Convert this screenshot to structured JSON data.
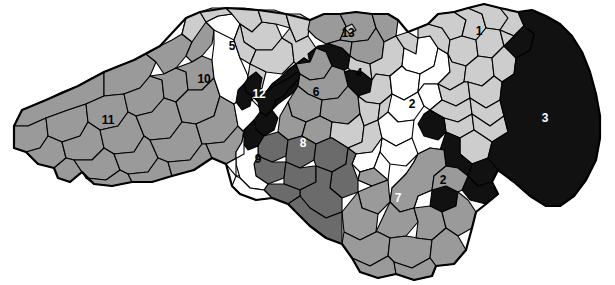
{
  "map": {
    "title": "North Carolina Congressional Districts",
    "region": "North Carolina",
    "width": 615,
    "height": 285,
    "background_color": "#ffffff",
    "border_color": "#000000"
  },
  "legend": {
    "shades": [
      {
        "key": "white",
        "color": "#ffffff",
        "label_color": "#000000"
      },
      {
        "key": "light_gray",
        "color": "#cdcdcd",
        "label_color": "#000000"
      },
      {
        "key": "medium_gray",
        "color": "#9a9a9a",
        "label_color": "#000000"
      },
      {
        "key": "dark_gray",
        "color": "#6b6b6b",
        "label_color": "#ffffff"
      },
      {
        "key": "black",
        "color": "#111111",
        "label_color": "#ffffff"
      }
    ]
  },
  "districts": [
    {
      "number": "1",
      "shade": "light_gray",
      "label_color": "#000000",
      "x": 479,
      "y": 31
    },
    {
      "number": "2",
      "shade": "white",
      "label_color": "#000000",
      "x": 412,
      "y": 104
    },
    {
      "number": "2b",
      "number_text": "2",
      "shade": "medium_gray",
      "label_color": "#000000",
      "x": 443,
      "y": 180
    },
    {
      "number": "3",
      "shade": "black",
      "label_color": "#ffffff",
      "x": 545,
      "y": 118
    },
    {
      "number": "4",
      "shade": "light_gray",
      "label_color": "#000000",
      "x": 359,
      "y": 73
    },
    {
      "number": "5",
      "shade": "light_gray",
      "label_color": "#000000",
      "x": 232,
      "y": 46
    },
    {
      "number": "6",
      "shade": "medium_gray",
      "label_color": "#000000",
      "x": 316,
      "y": 92
    },
    {
      "number": "7",
      "shade": "medium_gray",
      "label_color": "#ffffff",
      "x": 398,
      "y": 198
    },
    {
      "number": "8",
      "shade": "dark_gray",
      "label_color": "#ffffff",
      "x": 303,
      "y": 143
    },
    {
      "number": "9",
      "shade": "white",
      "label_color": "#000000",
      "x": 258,
      "y": 159
    },
    {
      "number": "10",
      "shade": "white",
      "label_color": "#000000",
      "x": 204,
      "y": 79
    },
    {
      "number": "11",
      "shade": "medium_gray",
      "label_color": "#000000",
      "x": 108,
      "y": 120
    },
    {
      "number": "12",
      "shade": "black",
      "label_color": "#ffffff",
      "x": 259,
      "y": 94
    },
    {
      "number": "13",
      "shade": "medium_gray",
      "label_color": "#000000",
      "x": 348,
      "y": 33
    }
  ]
}
